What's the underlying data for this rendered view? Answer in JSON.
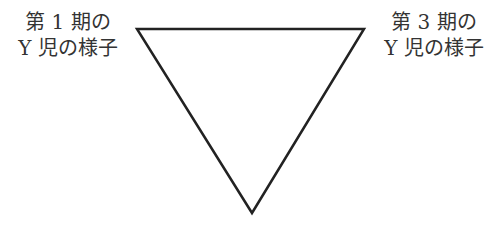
{
  "diagram": {
    "type": "inverted-triangle",
    "labels": {
      "top_left": {
        "line1": "第 1 期の",
        "line2": "Y 児の様子"
      },
      "top_right": {
        "line1": "第 3 期の",
        "line2": "Y 児の様子"
      }
    },
    "triangle": {
      "points": "137,29 364,29 252,213",
      "stroke": "#222222",
      "fill": "#ffffff"
    }
  }
}
